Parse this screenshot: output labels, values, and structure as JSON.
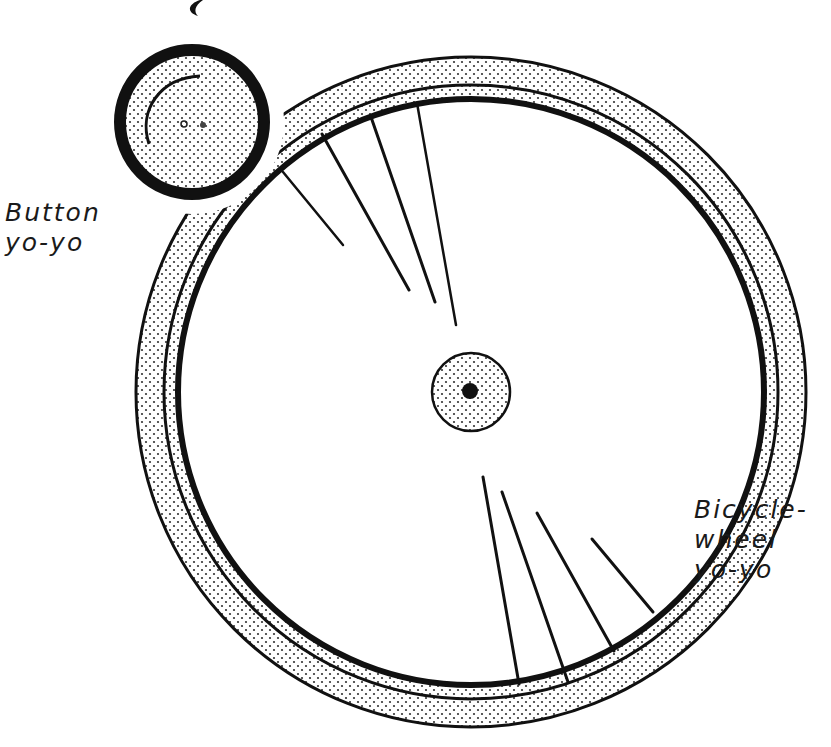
{
  "diagram": {
    "title": "",
    "labels": {
      "button_yoyo": {
        "line1": "Button",
        "line2": "yo-yo"
      },
      "bicycle_yoyo": {
        "line1": "Bicycle-",
        "line2": "wheel",
        "line3": "yo-yo"
      }
    },
    "objects": [
      {
        "name": "button-yoyo",
        "shape": "circle",
        "fill": "stippled",
        "border": "thick-black"
      },
      {
        "name": "bicycle-wheel-yoyo",
        "shape": "ring",
        "fill": "stippled",
        "parts": [
          "tire",
          "rim",
          "spokes",
          "hub"
        ]
      }
    ],
    "colors": {
      "ink": "#111111",
      "background": "#ffffff",
      "stipple": "#333333"
    }
  }
}
